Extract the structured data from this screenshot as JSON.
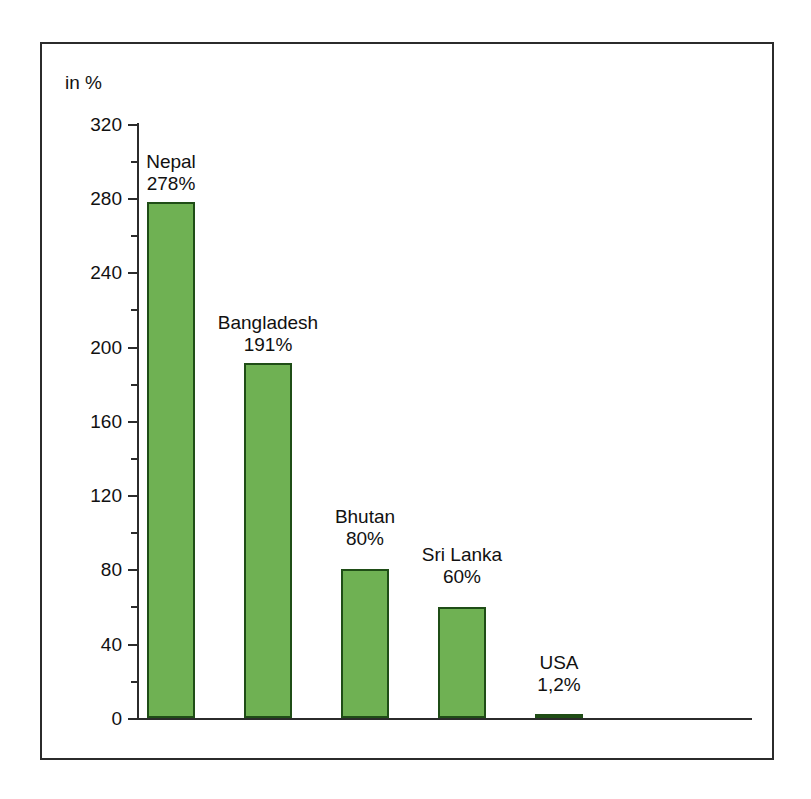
{
  "top_caption": "",
  "chart": {
    "axis_unit_label": "in %",
    "bar_color": "#6fb153",
    "bar_border_color": "#1f4d16",
    "axis_color": "#2b2b2b"
  },
  "chart_data": {
    "type": "bar",
    "title": "",
    "subtitle": "",
    "xlabel": "",
    "ylabel": "in %",
    "ylim": [
      0,
      320
    ],
    "ytick_major": [
      0,
      40,
      80,
      120,
      160,
      200,
      240,
      280,
      320
    ],
    "ytick_minor": [
      20,
      60,
      100,
      140,
      180,
      220,
      260,
      300
    ],
    "ytick_labels": [
      "0",
      "40",
      "80",
      "120",
      "160",
      "200",
      "240",
      "280",
      "320"
    ],
    "grid": false,
    "legend": false,
    "legend_position": "none",
    "categories": [
      "Nepal",
      "Bangladesh",
      "Bhutan",
      "Sri Lanka",
      "USA"
    ],
    "values": [
      278,
      191,
      80,
      60,
      1.2
    ],
    "data_labels": [
      "278%",
      "191%",
      "80%",
      "60%",
      "1,2%"
    ],
    "annotations": [
      "in %"
    ]
  }
}
